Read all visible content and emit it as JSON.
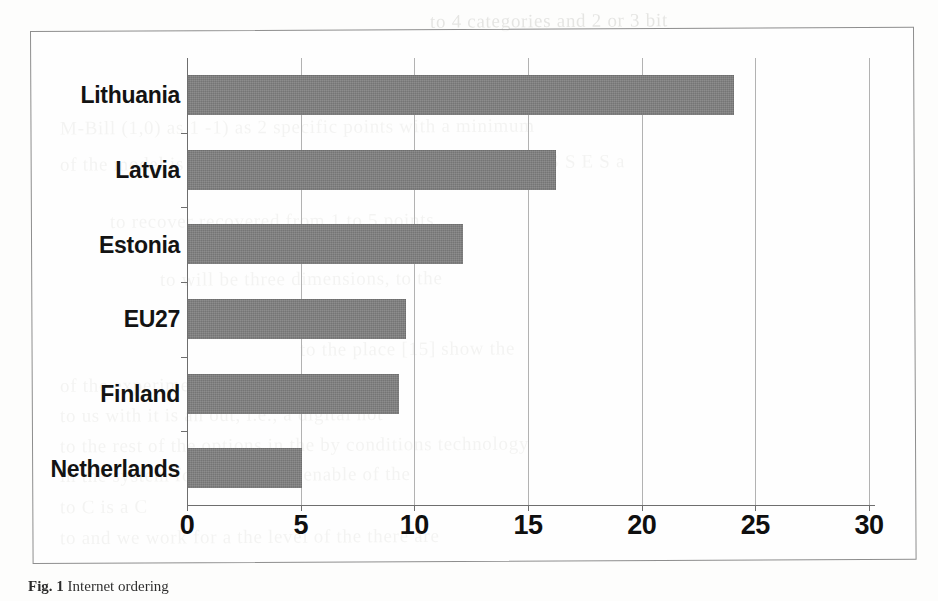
{
  "page": {
    "background_color": "#fdfdfc",
    "frame_color": "#8e8e8e"
  },
  "caption": {
    "label": "Fig. 1",
    "text": "Internet ordering"
  },
  "ghost_text": {
    "note": "faint show-through text from the reverse side of the scanned page",
    "lines": [
      "to 4 categories and 2 or 3 bit",
      "M-Bill (1,0) as 1 -1) as 2 specific points with a minimum",
      "of the model is an average of the level of the level of the I S S E S a",
      "to recover recovered from 1 to 5 points",
      "to will be three dimensions, to the",
      "to the place [15] show the",
      "of the experiment in the platform or",
      "to us with it is an out, i.e., a digital not",
      "to the rest of the options in the by conditions technology",
      "in the system for the S2 is in enable of the",
      "to C is a C",
      "to and we work for a the level of the there are"
    ]
  },
  "chart_data": {
    "type": "bar",
    "orientation": "horizontal",
    "title": "",
    "subtitle": "",
    "xlabel": "",
    "ylabel": "",
    "categories": [
      "Lithuania",
      "Latvia",
      "Estonia",
      "EU27",
      "Finland",
      "Netherlands"
    ],
    "values": [
      24.0,
      16.2,
      12.1,
      9.6,
      9.3,
      5.0
    ],
    "series": [
      {
        "name": "",
        "values": [
          24.0,
          16.2,
          12.1,
          9.6,
          9.3,
          5.0
        ]
      }
    ],
    "xlim": [
      0,
      30
    ],
    "xticks": [
      0,
      5,
      10,
      15,
      20,
      25,
      30
    ],
    "xtick_labels": [
      "0",
      "5",
      "10",
      "15",
      "20",
      "25",
      "30"
    ],
    "grid": "vertical-only",
    "legend": "none",
    "bar_color": "#808080",
    "axis_color": "#6e6e6e",
    "gridline_color": "#b2b2b2"
  }
}
